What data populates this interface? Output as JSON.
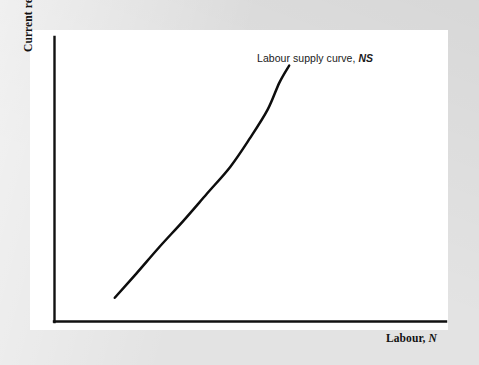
{
  "figure": {
    "background_color": "#e3e3e3",
    "panel_color": "#ffffff",
    "ink_color": "#111111"
  },
  "labels": {
    "y_axis_text": "Current real wage, ",
    "y_axis_symbol": "w",
    "x_axis_text": "Labour, ",
    "x_axis_symbol": "N",
    "curve_annotation_text": "Labour supply curve, ",
    "curve_annotation_symbol": "NS"
  },
  "chart_data": {
    "type": "line",
    "title": "",
    "subtitle": "",
    "xlabel": "Labour, N",
    "ylabel": "Current real wage, w",
    "grid": false,
    "legend": false,
    "legend_position": "none",
    "axis_style": "two-axis-lines-only",
    "tick_labels_x": [],
    "tick_labels_y": [],
    "xlim": [
      0,
      1
    ],
    "ylim": [
      0,
      1
    ],
    "annotations": [
      {
        "text": "Labour supply curve, NS",
        "italic_part": "NS",
        "attached_to": "labour-supply-curve",
        "position": "above-right-of-curve-top"
      }
    ],
    "series": [
      {
        "name": "Labour supply curve, NS",
        "description": "Upward-sloping, convex curve: real wage rises at an increasing rate with labour supplied",
        "color": "#0d0d0d",
        "line_width": 2.5,
        "x": [
          0.155,
          0.21,
          0.27,
          0.33,
          0.39,
          0.45,
          0.5,
          0.545,
          0.575,
          0.6
        ],
        "y": [
          0.085,
          0.17,
          0.265,
          0.355,
          0.45,
          0.545,
          0.645,
          0.745,
          0.84,
          0.9
        ]
      }
    ]
  }
}
